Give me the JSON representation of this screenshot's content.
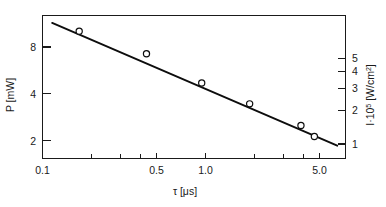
{
  "chart_data": {
    "type": "line",
    "title": "",
    "xlabel": "τ [μs]",
    "ylabel": "P [mW]",
    "ylabel_right": "I·10⁵ [W/cm²]",
    "xscale": "log",
    "yscale": "log",
    "xlim": [
      0.1,
      8.0
    ],
    "ylim": [
      1.55,
      11.2
    ],
    "ylim_right": [
      0.9,
      6.5
    ],
    "grid": false,
    "legend": null,
    "x_ticks": [
      {
        "value": 0.1,
        "label": "0.1",
        "major": true
      },
      {
        "value": 0.2,
        "label": "",
        "major": false
      },
      {
        "value": 0.3,
        "label": "",
        "major": false
      },
      {
        "value": 0.4,
        "label": "",
        "major": false
      },
      {
        "value": 0.5,
        "label": "0.5",
        "major": true
      },
      {
        "value": 1.0,
        "label": "1.0",
        "major": true
      },
      {
        "value": 2.0,
        "label": "",
        "major": false
      },
      {
        "value": 3.0,
        "label": "",
        "major": false
      },
      {
        "value": 4.0,
        "label": "",
        "major": false
      },
      {
        "value": 5.0,
        "label": "5.0",
        "major": true
      }
    ],
    "y_ticks_left": [
      {
        "value": 2,
        "label": "2"
      },
      {
        "value": 4,
        "label": "4"
      },
      {
        "value": 8,
        "label": "8"
      }
    ],
    "y_ticks_right": [
      {
        "value": 1,
        "label": "1"
      },
      {
        "value": 2,
        "label": "2"
      },
      {
        "value": 3,
        "label": "3"
      },
      {
        "value": 4,
        "label": "4"
      },
      {
        "value": 5,
        "label": "5"
      }
    ],
    "series": [
      {
        "name": "P vs tau",
        "marker": "open-circle",
        "x": [
          0.17,
          0.45,
          1.0,
          2.0,
          4.2,
          5.1
        ],
        "y": [
          9.0,
          6.6,
          4.4,
          3.3,
          2.45,
          2.1
        ]
      }
    ],
    "fit_line": {
      "name": "linear-fit",
      "x": [
        0.115,
        7.1
      ],
      "y": [
        10.1,
        1.85
      ]
    }
  },
  "axes": {
    "left_title": "P [mW]",
    "right_title_main": "I·10",
    "right_title_exp": "5",
    "right_title_tail": " [W/cm",
    "right_title_exp2": "2",
    "right_title_end": "]",
    "bottom_title": "τ [μs]"
  }
}
